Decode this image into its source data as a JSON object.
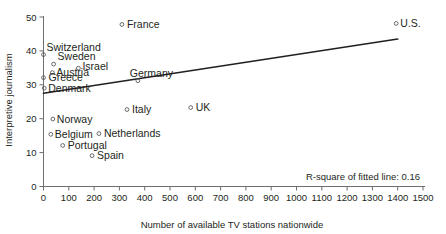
{
  "chart_data": {
    "type": "scatter",
    "title": "",
    "xlabel": "Number of available TV stations nationwide",
    "ylabel": "Interpretive journalism",
    "xlim": [
      0,
      1500
    ],
    "ylim": [
      0,
      50
    ],
    "xticks": [
      0,
      100,
      200,
      300,
      400,
      500,
      600,
      700,
      800,
      900,
      1000,
      1100,
      1200,
      1300,
      1400,
      1500
    ],
    "xtick_labels": [
      "0",
      "100",
      "200",
      "300",
      "400",
      "500",
      "600",
      "700",
      "800",
      "900",
      "1000",
      "1100",
      "1200",
      "1300",
      "1400",
      "1500"
    ],
    "yticks": [
      0,
      10,
      20,
      30,
      40,
      50
    ],
    "ytick_labels": [
      "0",
      "10",
      "20",
      "30",
      "40",
      "50"
    ],
    "grid": false,
    "legend": false,
    "annotation": "R-square of fitted line: 0.16",
    "fit_line": {
      "x": [
        0,
        1400
      ],
      "y": [
        27.5,
        43.5
      ]
    },
    "points": [
      {
        "label": "France",
        "x": 310,
        "y": 47.8,
        "label_dx": 5,
        "label_dy": 3.5
      },
      {
        "label": "U.S.",
        "x": 1394,
        "y": 48.1,
        "label_dx": 4,
        "label_dy": 3.5
      },
      {
        "label": "Switzerland",
        "x": 0,
        "y": 38.9,
        "label_dx": 3,
        "label_dy": -4
      },
      {
        "label": "Sweden",
        "x": 40,
        "y": 36.1,
        "label_dx": 4,
        "label_dy": -4
      },
      {
        "label": "Austria",
        "x": 35,
        "y": 33.6,
        "label_dx": 4,
        "label_dy": 3.5
      },
      {
        "label": "Israel",
        "x": 138,
        "y": 34.9,
        "label_dx": 4,
        "label_dy": 2
      },
      {
        "label": "Greece",
        "x": 0,
        "y": 32.1,
        "label_dx": 5,
        "label_dy": 3.5
      },
      {
        "label": "Denmark",
        "x": 3,
        "y": 29.0,
        "label_dx": 4,
        "label_dy": 3.5
      },
      {
        "label": "Germany",
        "x": 373,
        "y": 31.2,
        "label_dx": -8,
        "label_dy": -4
      },
      {
        "label": "Italy",
        "x": 330,
        "y": 22.7,
        "label_dx": 5,
        "label_dy": 3.5
      },
      {
        "label": "UK",
        "x": 582,
        "y": 23.3,
        "label_dx": 5,
        "label_dy": 3.5
      },
      {
        "label": "Norway",
        "x": 37,
        "y": 19.9,
        "label_dx": 4,
        "label_dy": 3.5
      },
      {
        "label": "Belgium",
        "x": 29,
        "y": 15.4,
        "label_dx": 4,
        "label_dy": 3.5
      },
      {
        "label": "Netherlands",
        "x": 219,
        "y": 15.6,
        "label_dx": 5,
        "label_dy": 3.5
      },
      {
        "label": "Portugal",
        "x": 76,
        "y": 12.1,
        "label_dx": 5,
        "label_dy": 3.5
      },
      {
        "label": "Spain",
        "x": 192,
        "y": 9.1,
        "label_dx": 5,
        "label_dy": 3.5
      }
    ]
  }
}
